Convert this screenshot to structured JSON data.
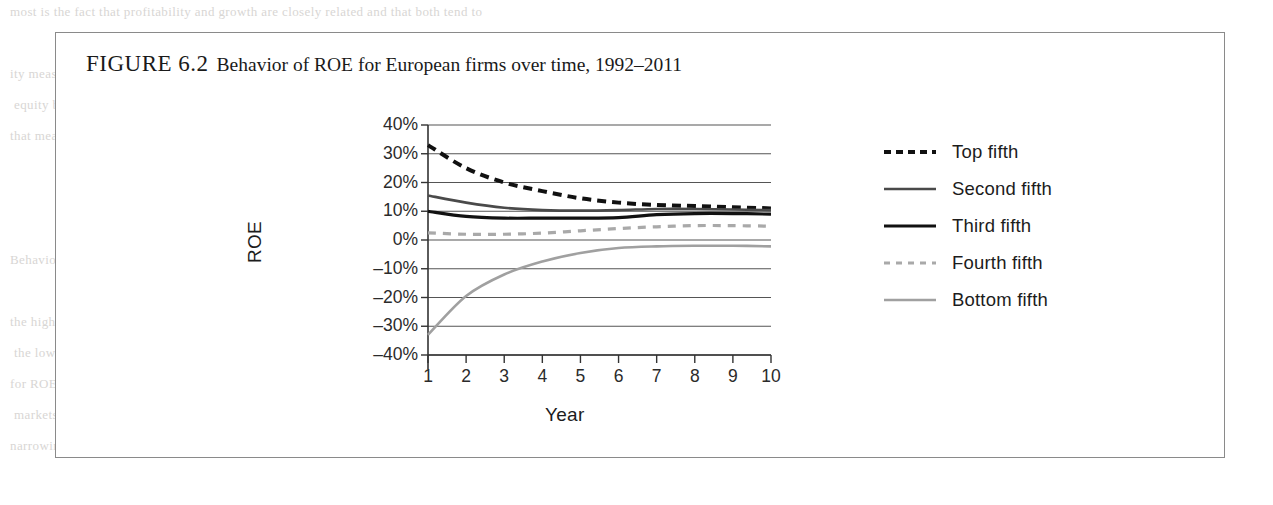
{
  "figure": {
    "label": "FIGURE 6.2",
    "caption": "Behavior of ROE for European firms over time, 1992–2011"
  },
  "chart_data": {
    "type": "line",
    "title": "Behavior of ROE for European firms over time, 1992–2011",
    "xlabel": "Year",
    "ylabel": "ROE",
    "x": [
      1,
      2,
      3,
      4,
      5,
      6,
      7,
      8,
      9,
      10
    ],
    "categories": [
      "1",
      "2",
      "3",
      "4",
      "5",
      "6",
      "7",
      "8",
      "9",
      "10"
    ],
    "ylim": [
      -40,
      40
    ],
    "ytick_values": [
      40,
      30,
      20,
      10,
      0,
      -10,
      -20,
      -30,
      -40
    ],
    "ytick_labels": [
      "40%",
      "30%",
      "20%",
      "10%",
      "0%",
      "–10%",
      "–20%",
      "–30%",
      "–40%"
    ],
    "xtick_labels": [
      "1",
      "2",
      "3",
      "4",
      "5",
      "6",
      "7",
      "8",
      "9",
      "10"
    ],
    "grid": "horizontal",
    "legend_position": "right",
    "series": [
      {
        "name": "Top fifth",
        "style": "dashed",
        "color": "#111111",
        "width": 4.0,
        "values": [
          33.0,
          25.0,
          20.0,
          17.0,
          14.5,
          13.0,
          12.2,
          11.8,
          11.4,
          11.0
        ]
      },
      {
        "name": "Second fifth",
        "style": "solid",
        "color": "#4a4a4a",
        "width": 2.6,
        "values": [
          15.5,
          13.0,
          11.2,
          10.4,
          10.2,
          10.4,
          10.8,
          10.8,
          10.6,
          10.4
        ]
      },
      {
        "name": "Third fifth",
        "style": "solid",
        "color": "#111111",
        "width": 3.2,
        "values": [
          10.0,
          8.2,
          7.6,
          7.6,
          7.6,
          7.8,
          8.8,
          9.2,
          9.2,
          9.0
        ]
      },
      {
        "name": "Fourth fifth",
        "style": "dashed",
        "color": "#a9a9a9",
        "width": 3.2,
        "values": [
          2.5,
          2.0,
          2.0,
          2.4,
          3.2,
          4.0,
          4.6,
          5.0,
          5.0,
          4.8
        ]
      },
      {
        "name": "Bottom fifth",
        "style": "solid",
        "color": "#a0a0a0",
        "width": 2.6,
        "values": [
          -33.0,
          -19.5,
          -12.0,
          -7.5,
          -4.5,
          -2.8,
          -2.2,
          -2.0,
          -2.0,
          -2.2
        ]
      }
    ]
  },
  "legend": {
    "items": [
      {
        "label": "Top fifth"
      },
      {
        "label": "Second fifth"
      },
      {
        "label": "Third fifth"
      },
      {
        "label": "Fourth fifth"
      },
      {
        "label": "Bottom fifth"
      }
    ]
  },
  "page_bleed": {
    "rows": [
      "   most  is  the  fact  that  profitability  and  growth  are  closely  related  and  that  both  tend  to",
      "",
      "   ity  measures  and  growth  for  the  median  firm  over  this  period  and  the",
      "   equity  by  the  book  value  of  equity  and  the  asset  growth  rate  is  measured",
      "   that  measures  of  profitability  are  related  to  a  company's  value  and  its",
      "",
      "",
      "",
      "   Behavior  and  Persistence",
      "",
      "   the  high  profitability  of  the  top  quintile  erodes  toward  the  median  over",
      "   the  low  profitability  of  the  bottom  quintile  improves  toward  the  median",
      "   for  ROE  to  revert  toward  the  mean  as  competitive  forces  operate  in  the",
      "   markets  over  the  medium  term  and  the  differences  narrow  substantially",
      "   narrowing  of  ROE  differences  across  quintiles  over  the  ten-year  horizon"
    ]
  }
}
